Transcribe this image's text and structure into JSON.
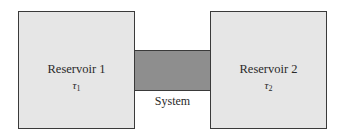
{
  "diagram": {
    "reservoir_1": {
      "label": "Reservoir 1",
      "temp_symbol": "τ",
      "temp_subscript": "1"
    },
    "reservoir_2": {
      "label": "Reservoir 2",
      "temp_symbol": "τ",
      "temp_subscript": "2"
    },
    "system": {
      "label": "System"
    }
  }
}
